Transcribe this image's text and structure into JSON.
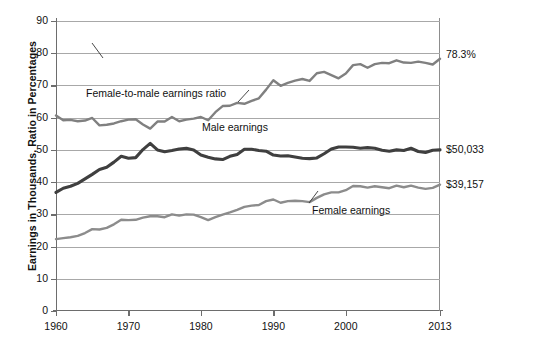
{
  "chart_data": {
    "type": "line",
    "title": "",
    "xlabel": "",
    "ylabel": "Earnings in Thousands, Ratio in Percentages",
    "xlim": [
      1960,
      2013
    ],
    "ylim": [
      0,
      90
    ],
    "ytick_step": 10,
    "grid": true,
    "legend": "inline-annotations",
    "xticks": [
      "1960",
      "1970",
      "1980",
      "1990",
      "2000",
      "2013"
    ],
    "yticks": [
      "0",
      "10",
      "20",
      "30",
      "40",
      "50",
      "60",
      "70",
      "80",
      "90"
    ],
    "x": [
      1960,
      1961,
      1962,
      1963,
      1964,
      1965,
      1966,
      1967,
      1968,
      1969,
      1970,
      1971,
      1972,
      1973,
      1974,
      1975,
      1976,
      1977,
      1978,
      1979,
      1980,
      1981,
      1982,
      1983,
      1984,
      1985,
      1986,
      1987,
      1988,
      1989,
      1990,
      1991,
      1992,
      1993,
      1994,
      1995,
      1996,
      1997,
      1998,
      1999,
      2000,
      2001,
      2002,
      2003,
      2004,
      2005,
      2006,
      2007,
      2008,
      2009,
      2010,
      2011,
      2012,
      2013
    ],
    "series": [
      {
        "name": "Female-to-male earnings ratio",
        "color": "#808080",
        "unit": "percent",
        "end_label": "78.3%",
        "values": [
          60.7,
          59.2,
          59.3,
          58.9,
          59.1,
          59.9,
          57.6,
          57.8,
          58.2,
          58.9,
          59.4,
          59.5,
          57.9,
          56.6,
          58.8,
          58.8,
          60.2,
          58.9,
          59.4,
          59.7,
          60.2,
          59.2,
          61.7,
          63.6,
          63.7,
          64.6,
          64.3,
          65.2,
          66.0,
          68.7,
          71.6,
          69.9,
          70.8,
          71.5,
          72.0,
          71.4,
          73.8,
          74.2,
          73.2,
          72.2,
          73.7,
          76.3,
          76.6,
          75.5,
          76.6,
          77.0,
          76.9,
          77.8,
          77.1,
          77.0,
          77.4,
          77.0,
          76.5,
          78.3
        ]
      },
      {
        "name": "Male earnings",
        "color": "#3f3f3f",
        "unit": "thousands of dollars",
        "end_label": "$50,033",
        "values": [
          36.8,
          38.1,
          38.7,
          39.6,
          41.0,
          42.4,
          43.9,
          44.6,
          46.2,
          48.0,
          47.4,
          47.6,
          50.1,
          52.0,
          50.0,
          49.4,
          49.8,
          50.3,
          50.5,
          50.0,
          48.4,
          47.7,
          47.2,
          47.0,
          48.0,
          48.6,
          50.2,
          50.2,
          49.8,
          49.6,
          48.4,
          48.1,
          48.2,
          47.8,
          47.4,
          47.3,
          47.5,
          48.8,
          50.3,
          50.9,
          50.9,
          50.8,
          50.5,
          50.7,
          50.5,
          49.9,
          49.6,
          50.0,
          49.8,
          50.5,
          49.5,
          49.2,
          49.9,
          50.0
        ]
      },
      {
        "name": "Female earnings",
        "color": "#8c8c8c",
        "unit": "thousands of dollars",
        "end_label": "$39,157",
        "values": [
          22.3,
          22.6,
          22.9,
          23.3,
          24.2,
          25.4,
          25.3,
          25.8,
          26.9,
          28.3,
          28.2,
          28.3,
          29.0,
          29.4,
          29.4,
          29.1,
          30.0,
          29.6,
          30.0,
          29.9,
          29.1,
          28.2,
          29.1,
          29.9,
          30.6,
          31.4,
          32.3,
          32.7,
          32.9,
          34.1,
          34.6,
          33.6,
          34.1,
          34.2,
          34.1,
          33.8,
          35.1,
          36.2,
          36.8,
          36.8,
          37.5,
          38.8,
          38.7,
          38.3,
          38.7,
          38.4,
          38.1,
          38.9,
          38.4,
          38.9,
          38.3,
          37.9,
          38.2,
          39.2
        ]
      }
    ],
    "annotations": [
      {
        "text": "Female-to-male earnings ratio",
        "target_series": "Female-to-male earnings ratio"
      },
      {
        "text": "Male earnings",
        "target_series": "Male earnings"
      },
      {
        "text": "Female earnings",
        "target_series": "Female earnings"
      }
    ]
  }
}
